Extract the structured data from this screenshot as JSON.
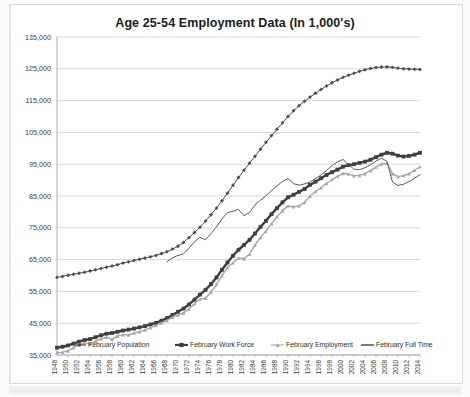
{
  "chart_data": {
    "type": "line",
    "title": "Age 25-54 Employment Data (In 1,000's)",
    "xlabel": "",
    "ylabel": "",
    "ylim": [
      35000,
      135000
    ],
    "ytick_step": 10000,
    "ytick_labels": [
      "35,000",
      "45,000",
      "55,000",
      "65,000",
      "75,000",
      "85,000",
      "95,000",
      "105,000",
      "115,000",
      "125,000",
      "135,000"
    ],
    "grid": true,
    "legend_position": "bottom",
    "xlim": [
      1948,
      2014
    ],
    "xtick_step": 2,
    "x": [
      1948,
      1949,
      1950,
      1951,
      1952,
      1953,
      1954,
      1955,
      1956,
      1957,
      1958,
      1959,
      1960,
      1961,
      1962,
      1963,
      1964,
      1965,
      1966,
      1967,
      1968,
      1969,
      1970,
      1971,
      1972,
      1973,
      1974,
      1975,
      1976,
      1977,
      1978,
      1979,
      1980,
      1981,
      1982,
      1983,
      1984,
      1985,
      1986,
      1987,
      1988,
      1989,
      1990,
      1991,
      1992,
      1993,
      1994,
      1995,
      1996,
      1997,
      1998,
      1999,
      2000,
      2001,
      2002,
      2003,
      2004,
      2005,
      2006,
      2007,
      2008,
      2009,
      2010,
      2011,
      2012,
      2013,
      2014
    ],
    "xtick_labels": [
      "1948",
      "1950",
      "1952",
      "1954",
      "1956",
      "1958",
      "1960",
      "1962",
      "1964",
      "1966",
      "1968",
      "1970",
      "1972",
      "1974",
      "1976",
      "1978",
      "1980",
      "1982",
      "1984",
      "1986",
      "1988",
      "1990",
      "1992",
      "1994",
      "1996",
      "1998",
      "2000",
      "2002",
      "2004",
      "2006",
      "2008",
      "2010",
      "2012",
      "2014"
    ],
    "series": [
      {
        "name": "February Population",
        "marker": "diamond",
        "color": "#4a4a4a",
        "line_width": 1.0,
        "values": [
          59400,
          59700,
          60100,
          60400,
          60700,
          61000,
          61400,
          61800,
          62200,
          62600,
          63000,
          63400,
          63900,
          64300,
          64700,
          65100,
          65500,
          65900,
          66300,
          66900,
          67500,
          68300,
          69200,
          70400,
          71900,
          73500,
          75200,
          77100,
          79100,
          81200,
          83500,
          85900,
          88400,
          90800,
          93100,
          95300,
          97500,
          99700,
          101900,
          104000,
          106000,
          108000,
          110000,
          111800,
          113400,
          114800,
          116100,
          117300,
          118500,
          119600,
          120600,
          121500,
          122300,
          123000,
          123600,
          124200,
          124700,
          125100,
          125400,
          125550,
          125600,
          125450,
          125200,
          125000,
          124900,
          124850,
          124800
        ]
      },
      {
        "name": "February Work Force",
        "marker": "square",
        "color": "#3f3f3f",
        "line_width": 2.4,
        "values": [
          37300,
          37600,
          38000,
          38600,
          39200,
          39700,
          40000,
          40600,
          41200,
          41700,
          41900,
          42300,
          42700,
          43000,
          43300,
          43700,
          44100,
          44600,
          45100,
          45800,
          46600,
          47600,
          48600,
          49600,
          50900,
          52400,
          54000,
          55500,
          57300,
          59400,
          61800,
          64100,
          66200,
          68100,
          69600,
          71200,
          73200,
          75300,
          77200,
          79300,
          81200,
          83000,
          84600,
          85400,
          86300,
          87200,
          88500,
          89500,
          90600,
          91600,
          92500,
          93300,
          94200,
          94700,
          95000,
          95400,
          95800,
          96400,
          97200,
          98000,
          98600,
          98300,
          97700,
          97400,
          97600,
          98000,
          98600
        ]
      },
      {
        "name": "February Employment",
        "marker": "triangle",
        "color": "#a6a6a6",
        "line_width": 1.4,
        "values": [
          35800,
          35900,
          36300,
          37300,
          38200,
          38800,
          38500,
          39400,
          40100,
          40600,
          39900,
          41000,
          41400,
          41300,
          41900,
          42300,
          42900,
          43600,
          44300,
          45100,
          45900,
          46900,
          47600,
          48200,
          49500,
          51100,
          52600,
          52900,
          54800,
          57200,
          60000,
          62500,
          64000,
          65500,
          65300,
          66700,
          69600,
          72000,
          74000,
          76300,
          78500,
          80400,
          81900,
          81600,
          81900,
          83000,
          84900,
          86400,
          87600,
          89000,
          90200,
          91200,
          92100,
          91900,
          91400,
          91500,
          92000,
          93000,
          94100,
          95100,
          95300,
          92000,
          91100,
          91400,
          92000,
          93100,
          94200
        ]
      },
      {
        "name": "February Full Time",
        "marker": "none",
        "color": "#5a5a5a",
        "line_width": 1.0,
        "values": [
          null,
          null,
          null,
          null,
          null,
          null,
          null,
          null,
          null,
          null,
          null,
          null,
          null,
          null,
          null,
          null,
          null,
          null,
          null,
          null,
          64300,
          65600,
          66300,
          66800,
          68600,
          70600,
          72000,
          71200,
          73200,
          75300,
          77800,
          79800,
          80200,
          80800,
          78800,
          79800,
          82200,
          83700,
          85100,
          86700,
          88200,
          89600,
          90400,
          88900,
          88400,
          88800,
          89400,
          90500,
          91600,
          93000,
          94600,
          95700,
          96500,
          94900,
          93400,
          93300,
          93900,
          94800,
          96000,
          96900,
          95900,
          89400,
          88300,
          88700,
          89500,
          90600,
          91700
        ]
      }
    ]
  }
}
